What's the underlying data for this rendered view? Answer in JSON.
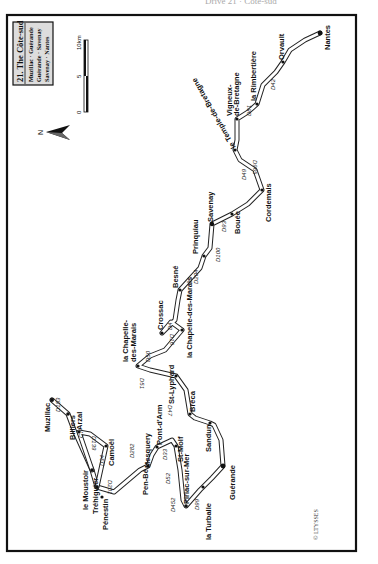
{
  "header": {
    "running_text": "Drive 21 · Côte-sud"
  },
  "legend": {
    "title": "21. The Côte-sud",
    "lines": [
      "Muzillac · Guérande",
      "Guérande · Savenay",
      "Savenay · Nantes"
    ]
  },
  "scale": {
    "zero": "0",
    "mid": "5",
    "max": "10km"
  },
  "north": {
    "label": "N"
  },
  "copyright": "© LTYSSES",
  "colors": {
    "border": "#111111",
    "road_fill": "#ffffff",
    "road_edge": "#222222",
    "town": "#111111"
  },
  "towns": [
    {
      "name": "Muzillac",
      "x": 52,
      "y": 400
    },
    {
      "name": "Billiers",
      "x": 68,
      "y": 414
    },
    {
      "name": "le Moustoir",
      "x": 92,
      "y": 473
    },
    {
      "name": "Tréhiguier",
      "x": 97,
      "y": 487
    },
    {
      "name": "Pénestin",
      "x": 102,
      "y": 497
    },
    {
      "name": "Arzal",
      "x": 79,
      "y": 432
    },
    {
      "name": "Camoël",
      "x": 106,
      "y": 446
    },
    {
      "name": "Pen-Bé",
      "x": 148,
      "y": 458
    },
    {
      "name": "Mesquery",
      "x": 148,
      "y": 470
    },
    {
      "name": "Pont-d'Arm",
      "x": 157,
      "y": 447
    },
    {
      "name": "St-Molf",
      "x": 174,
      "y": 435
    },
    {
      "name": "Piriac-sur-Mer",
      "x": 185,
      "y": 503
    },
    {
      "name": "la Turballe",
      "x": 203,
      "y": 487
    },
    {
      "name": "Guérande",
      "x": 223,
      "y": 466
    },
    {
      "name": "Sandun",
      "x": 210,
      "y": 424
    },
    {
      "name": "Bréca",
      "x": 190,
      "y": 414
    },
    {
      "name": "St-Lyphard",
      "x": 174,
      "y": 373
    },
    {
      "name": "la Chapelle-des-Marais",
      "x": 138,
      "y": 366
    },
    {
      "name": "St-Joachim",
      "x": 182,
      "y": 330
    },
    {
      "name": "Crossac",
      "x": 162,
      "y": 333
    },
    {
      "name": "Besné",
      "x": 177,
      "y": 295
    },
    {
      "name": "Prinquiau",
      "x": 204,
      "y": 256
    },
    {
      "name": "Savenay",
      "x": 212,
      "y": 224
    },
    {
      "name": "Bouée",
      "x": 232,
      "y": 214
    },
    {
      "name": "Cordemais",
      "x": 262,
      "y": 190
    },
    {
      "name": "le Temple-de-Bretagne",
      "x": 235,
      "y": 150
    },
    {
      "name": "Vigneux-de-Bretagne",
      "x": 237,
      "y": 119
    },
    {
      "name": "la Rimbertière",
      "x": 257,
      "y": 104
    },
    {
      "name": "Orvault",
      "x": 283,
      "y": 62
    },
    {
      "name": "Nantes",
      "x": 320,
      "y": 33
    }
  ],
  "roads": [
    "D153",
    "C7",
    "D34",
    "D139",
    "D201",
    "D282",
    "D33",
    "D52",
    "D452",
    "D99",
    "D47",
    "D51",
    "D50",
    "D16",
    "D4",
    "D204",
    "D100",
    "D93",
    "D49",
    "D965",
    "D81",
    "D42"
  ]
}
